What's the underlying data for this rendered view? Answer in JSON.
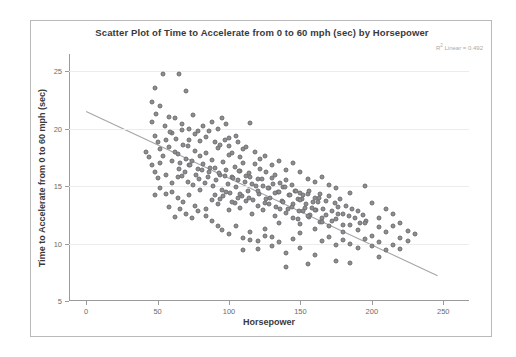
{
  "chart_data": {
    "type": "scatter",
    "title": "Scatter Plot of Time to Accelerate from 0 to 60 mph (sec) by Horsepower",
    "xlabel": "Horsepower",
    "ylabel": "Time to Accelerate from 0 to 60 mph (sec)",
    "annotation": "R² Linear = 0.492",
    "annotation_prefix": "R",
    "annotation_sup": "2",
    "annotation_suffix": " Linear = 0.492",
    "xlim": [
      -12,
      268
    ],
    "ylim": [
      5,
      26.5
    ],
    "xticks": [
      0,
      50,
      100,
      150,
      200,
      250
    ],
    "yticks": [
      5,
      10,
      15,
      20,
      25
    ],
    "grid": "horizontal",
    "legend": "none",
    "marker_color": "#8e8e90",
    "marker_edge_color": "#6f6f72",
    "fit_line_color": "#a6a6a8",
    "fit_line": {
      "x0": 0,
      "y0": 21.5,
      "x1": 246,
      "y1": 7.2,
      "r_squared": 0.492
    },
    "points": [
      [
        48,
        23.5
      ],
      [
        54,
        24.8
      ],
      [
        46,
        22.3
      ],
      [
        52,
        22.0
      ],
      [
        49,
        21.3
      ],
      [
        58,
        21.0
      ],
      [
        46,
        20.6
      ],
      [
        65,
        24.8
      ],
      [
        70,
        23.3
      ],
      [
        62,
        20.9
      ],
      [
        67,
        20.4
      ],
      [
        60,
        19.6
      ],
      [
        72,
        20.0
      ],
      [
        75,
        21.2
      ],
      [
        88,
        20.6
      ],
      [
        95,
        20.9
      ],
      [
        84,
        19.3
      ],
      [
        90,
        18.8
      ],
      [
        78,
        19.8
      ],
      [
        82,
        20.2
      ],
      [
        97,
        19.0
      ],
      [
        100,
        18.5
      ],
      [
        105,
        19.4
      ],
      [
        110,
        18.2
      ],
      [
        115,
        20.5
      ],
      [
        102,
        17.9
      ],
      [
        108,
        17.5
      ],
      [
        48,
        19.4
      ],
      [
        50,
        18.8
      ],
      [
        52,
        18.2
      ],
      [
        54,
        17.6
      ],
      [
        56,
        19.0
      ],
      [
        58,
        18.4
      ],
      [
        60,
        17.2
      ],
      [
        62,
        18.0
      ],
      [
        64,
        17.8
      ],
      [
        66,
        17.0
      ],
      [
        68,
        18.6
      ],
      [
        70,
        17.4
      ],
      [
        72,
        16.8
      ],
      [
        74,
        17.2
      ],
      [
        76,
        18.1
      ],
      [
        78,
        16.5
      ],
      [
        80,
        17.6
      ],
      [
        82,
        16.9
      ],
      [
        84,
        17.9
      ],
      [
        86,
        16.2
      ],
      [
        88,
        17.3
      ],
      [
        90,
        16.6
      ],
      [
        92,
        18.3
      ],
      [
        94,
        16.0
      ],
      [
        96,
        17.1
      ],
      [
        98,
        16.4
      ],
      [
        100,
        17.7
      ],
      [
        102,
        15.8
      ],
      [
        104,
        16.7
      ],
      [
        106,
        15.5
      ],
      [
        108,
        16.3
      ],
      [
        110,
        17.0
      ],
      [
        112,
        15.9
      ],
      [
        114,
        16.1
      ],
      [
        116,
        15.2
      ],
      [
        118,
        16.9
      ],
      [
        120,
        15.6
      ],
      [
        122,
        16.5
      ],
      [
        124,
        15.0
      ],
      [
        126,
        16.2
      ],
      [
        128,
        14.8
      ],
      [
        130,
        15.7
      ],
      [
        132,
        16.0
      ],
      [
        134,
        14.5
      ],
      [
        136,
        15.3
      ],
      [
        138,
        14.9
      ],
      [
        140,
        15.5
      ],
      [
        142,
        14.2
      ],
      [
        144,
        15.1
      ],
      [
        146,
        14.6
      ],
      [
        148,
        13.9
      ],
      [
        150,
        14.4
      ],
      [
        65,
        16.5
      ],
      [
        67,
        15.9
      ],
      [
        69,
        16.2
      ],
      [
        71,
        15.4
      ],
      [
        73,
        16.8
      ],
      [
        75,
        15.1
      ],
      [
        77,
        16.0
      ],
      [
        79,
        15.6
      ],
      [
        81,
        16.4
      ],
      [
        83,
        15.3
      ],
      [
        85,
        15.8
      ],
      [
        87,
        16.6
      ],
      [
        89,
        15.0
      ],
      [
        91,
        15.5
      ],
      [
        93,
        16.1
      ],
      [
        95,
        14.7
      ],
      [
        97,
        15.9
      ],
      [
        99,
        15.2
      ],
      [
        101,
        14.4
      ],
      [
        103,
        15.7
      ],
      [
        105,
        14.9
      ],
      [
        107,
        16.3
      ],
      [
        109,
        14.1
      ],
      [
        111,
        15.4
      ],
      [
        113,
        14.6
      ],
      [
        115,
        15.8
      ],
      [
        117,
        13.8
      ],
      [
        119,
        15.0
      ],
      [
        121,
        14.3
      ],
      [
        123,
        15.6
      ],
      [
        125,
        13.5
      ],
      [
        127,
        14.8
      ],
      [
        129,
        14.0
      ],
      [
        131,
        15.2
      ],
      [
        133,
        13.2
      ],
      [
        135,
        14.5
      ],
      [
        137,
        13.7
      ],
      [
        139,
        14.9
      ],
      [
        141,
        13.0
      ],
      [
        143,
        14.2
      ],
      [
        145,
        13.4
      ],
      [
        147,
        14.6
      ],
      [
        149,
        12.8
      ],
      [
        151,
        13.9
      ],
      [
        153,
        13.1
      ],
      [
        155,
        14.3
      ],
      [
        157,
        12.5
      ],
      [
        159,
        13.6
      ],
      [
        161,
        12.9
      ],
      [
        163,
        14.0
      ],
      [
        165,
        12.2
      ],
      [
        60,
        14.5
      ],
      [
        64,
        14.0
      ],
      [
        68,
        13.6
      ],
      [
        72,
        14.2
      ],
      [
        76,
        13.3
      ],
      [
        80,
        14.7
      ],
      [
        84,
        13.0
      ],
      [
        88,
        13.8
      ],
      [
        92,
        13.4
      ],
      [
        96,
        14.1
      ],
      [
        100,
        12.9
      ],
      [
        104,
        13.5
      ],
      [
        108,
        13.1
      ],
      [
        112,
        13.7
      ],
      [
        116,
        12.6
      ],
      [
        120,
        13.3
      ],
      [
        124,
        12.9
      ],
      [
        128,
        13.4
      ],
      [
        132,
        12.4
      ],
      [
        136,
        13.0
      ],
      [
        140,
        12.7
      ],
      [
        144,
        13.2
      ],
      [
        148,
        12.1
      ],
      [
        152,
        12.8
      ],
      [
        156,
        12.3
      ],
      [
        160,
        12.9
      ],
      [
        164,
        11.9
      ],
      [
        168,
        12.5
      ],
      [
        172,
        12.0
      ],
      [
        176,
        12.6
      ],
      [
        180,
        11.6
      ],
      [
        150,
        13.8
      ],
      [
        152,
        14.2
      ],
      [
        154,
        13.4
      ],
      [
        156,
        14.6
      ],
      [
        158,
        13.1
      ],
      [
        160,
        14.0
      ],
      [
        162,
        13.6
      ],
      [
        164,
        14.3
      ],
      [
        166,
        13.0
      ],
      [
        168,
        13.7
      ],
      [
        170,
        14.1
      ],
      [
        172,
        12.8
      ],
      [
        174,
        13.5
      ],
      [
        176,
        13.2
      ],
      [
        178,
        13.9
      ],
      [
        180,
        12.6
      ],
      [
        182,
        13.3
      ],
      [
        184,
        12.4
      ],
      [
        186,
        13.0
      ],
      [
        188,
        12.2
      ],
      [
        190,
        12.8
      ],
      [
        192,
        11.8
      ],
      [
        194,
        12.5
      ],
      [
        196,
        12.0
      ],
      [
        145,
        12.2
      ],
      [
        150,
        11.7
      ],
      [
        155,
        12.4
      ],
      [
        160,
        11.3
      ],
      [
        165,
        11.9
      ],
      [
        170,
        11.5
      ],
      [
        175,
        12.1
      ],
      [
        180,
        11.0
      ],
      [
        185,
        11.6
      ],
      [
        190,
        11.2
      ],
      [
        195,
        11.8
      ],
      [
        200,
        10.7
      ],
      [
        205,
        11.4
      ],
      [
        210,
        11.0
      ],
      [
        215,
        11.5
      ],
      [
        220,
        10.5
      ],
      [
        225,
        11.1
      ],
      [
        230,
        10.8
      ],
      [
        195,
        15.0
      ],
      [
        200,
        13.5
      ],
      [
        205,
        12.2
      ],
      [
        210,
        13.0
      ],
      [
        215,
        12.6
      ],
      [
        220,
        11.8
      ],
      [
        165,
        10.2
      ],
      [
        170,
        10.6
      ],
      [
        175,
        9.9
      ],
      [
        180,
        10.3
      ],
      [
        185,
        10.0
      ],
      [
        190,
        9.6
      ],
      [
        195,
        10.4
      ],
      [
        200,
        9.8
      ],
      [
        205,
        10.1
      ],
      [
        210,
        9.4
      ],
      [
        215,
        9.9
      ],
      [
        220,
        9.5
      ],
      [
        225,
        10.2
      ],
      [
        140,
        8.0
      ],
      [
        155,
        8.2
      ],
      [
        175,
        8.5
      ],
      [
        185,
        8.3
      ],
      [
        205,
        8.8
      ],
      [
        95,
        11.2
      ],
      [
        100,
        10.8
      ],
      [
        105,
        11.5
      ],
      [
        110,
        10.5
      ],
      [
        115,
        11.0
      ],
      [
        120,
        10.2
      ],
      [
        125,
        11.3
      ],
      [
        130,
        10.6
      ],
      [
        135,
        11.8
      ],
      [
        88,
        12.0
      ],
      [
        92,
        11.5
      ],
      [
        84,
        12.4
      ],
      [
        78,
        12.8
      ],
      [
        74,
        12.2
      ],
      [
        70,
        12.6
      ],
      [
        66,
        13.0
      ],
      [
        62,
        12.3
      ],
      [
        58,
        13.2
      ],
      [
        120,
        9.5
      ],
      [
        130,
        9.8
      ],
      [
        140,
        9.2
      ],
      [
        150,
        9.6
      ],
      [
        160,
        9.0
      ],
      [
        110,
        9.4
      ],
      [
        46,
        16.8
      ],
      [
        48,
        16.2
      ],
      [
        50,
        15.7
      ],
      [
        52,
        17.0
      ],
      [
        44,
        17.5
      ],
      [
        42,
        18.0
      ],
      [
        56,
        16.0
      ],
      [
        60,
        15.3
      ],
      [
        64,
        15.8
      ],
      [
        56,
        14.3
      ],
      [
        52,
        14.8
      ],
      [
        48,
        14.2
      ],
      [
        130,
        16.8
      ],
      [
        135,
        17.2
      ],
      [
        125,
        17.6
      ],
      [
        140,
        16.4
      ],
      [
        145,
        17.0
      ],
      [
        150,
        16.2
      ],
      [
        118,
        18.0
      ],
      [
        122,
        17.4
      ],
      [
        112,
        18.4
      ],
      [
        106,
        18.8
      ],
      [
        100,
        19.2
      ],
      [
        94,
        18.6
      ],
      [
        160,
        15.4
      ],
      [
        165,
        15.8
      ],
      [
        170,
        15.1
      ],
      [
        175,
        14.8
      ],
      [
        155,
        15.6
      ],
      [
        185,
        14.4
      ],
      [
        72,
        19.0
      ],
      [
        76,
        19.5
      ],
      [
        80,
        18.9
      ],
      [
        86,
        19.8
      ],
      [
        92,
        20.0
      ],
      [
        98,
        20.4
      ],
      [
        55,
        20.2
      ],
      [
        59,
        19.7
      ],
      [
        63,
        19.1
      ],
      [
        67,
        19.9
      ],
      [
        71,
        18.5
      ],
      [
        108,
        14.3
      ],
      [
        114,
        14.0
      ],
      [
        120,
        14.6
      ],
      [
        126,
        13.9
      ],
      [
        132,
        14.4
      ],
      [
        138,
        13.6
      ],
      [
        90,
        14.2
      ],
      [
        94,
        13.9
      ],
      [
        98,
        14.5
      ],
      [
        102,
        13.6
      ],
      [
        106,
        14.0
      ],
      [
        150,
        10.9
      ],
      [
        145,
        10.4
      ],
      [
        135,
        10.1
      ],
      [
        125,
        10.7
      ],
      [
        115,
        10.3
      ]
    ]
  }
}
